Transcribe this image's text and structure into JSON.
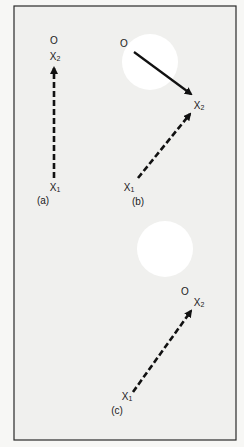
{
  "figure": {
    "colors": {
      "background": "#f7f7f5",
      "panel": "#f0f0ee",
      "border": "#2a2a2a",
      "ink": "#111111",
      "blob": "#ffffff"
    },
    "panels": [
      {
        "id": "a",
        "caption": "(a)",
        "origin_label": "O",
        "x2_label": "X",
        "x2_sub": "2",
        "x1_label": "X",
        "x1_sub": "1"
      },
      {
        "id": "b",
        "caption": "(b)",
        "origin_label": "O",
        "x2_label": "X",
        "x2_sub": "2",
        "x1_label": "X",
        "x1_sub": "1"
      },
      {
        "id": "c",
        "caption": "(c)",
        "origin_label": "O",
        "x2_label": "X",
        "x2_sub": "2",
        "x1_label": "X",
        "x1_sub": "1"
      }
    ]
  }
}
